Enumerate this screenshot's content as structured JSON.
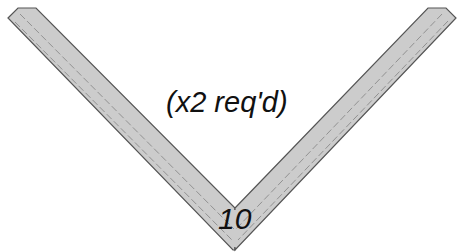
{
  "diagram": {
    "part": {
      "shape": "V-shaped bent strip",
      "fill_color": "#cccccc",
      "outline_color": "#555555",
      "centerline_color": "#888888",
      "centerline_style": "dashed"
    },
    "quantity_note": "(x2 req'd)",
    "part_number": "10"
  }
}
